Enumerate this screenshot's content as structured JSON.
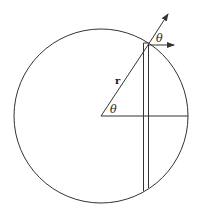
{
  "diagram": {
    "title": "",
    "labels": {
      "radius": "r",
      "angle_center": "θ",
      "angle_surface": "θ"
    },
    "colors": {
      "stroke": "#333333",
      "background": "#ffffff"
    },
    "geometry": {
      "circle": {
        "cx": 101,
        "cy": 116,
        "r": 87
      },
      "radius_line": {
        "x1": 101,
        "y1": 116,
        "x2": 148,
        "y2": 45
      },
      "radial_arrow": {
        "x1": 148,
        "y1": 45,
        "x2": 168,
        "y2": 14
      },
      "horizontal_arrow": {
        "x1": 148,
        "y1": 45,
        "x2": 174,
        "y2": 44
      },
      "horizontal_axis": {
        "x1": 101,
        "y1": 116,
        "x2": 188,
        "y2": 116
      },
      "strip_left": {
        "x1": 143,
        "y1": 42,
        "x2": 144,
        "y2": 191
      },
      "strip_right": {
        "x1": 149,
        "y1": 44,
        "x2": 149,
        "y2": 188
      }
    }
  }
}
